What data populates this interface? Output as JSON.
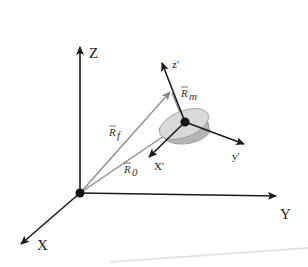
{
  "diagram": {
    "type": "3d-coordinate-frames",
    "global_axes": {
      "z_label": "Z",
      "y_label": "Y",
      "x_label": "X"
    },
    "local_axes": {
      "z_label": "z'",
      "y_label": "y'",
      "x_label": "X'"
    },
    "vectors": {
      "r_f": {
        "symbol": "R",
        "subscript": "f"
      },
      "r_m": {
        "symbol": "R",
        "subscript": "m"
      },
      "r_0": {
        "symbol": "R",
        "subscript": "0"
      }
    },
    "colors": {
      "axis": "#1a1a1a",
      "vector": "#8a8a8a",
      "disk_top": "#d9d9d9",
      "disk_side": "#b5b5b5",
      "background": "#ffffff"
    }
  }
}
